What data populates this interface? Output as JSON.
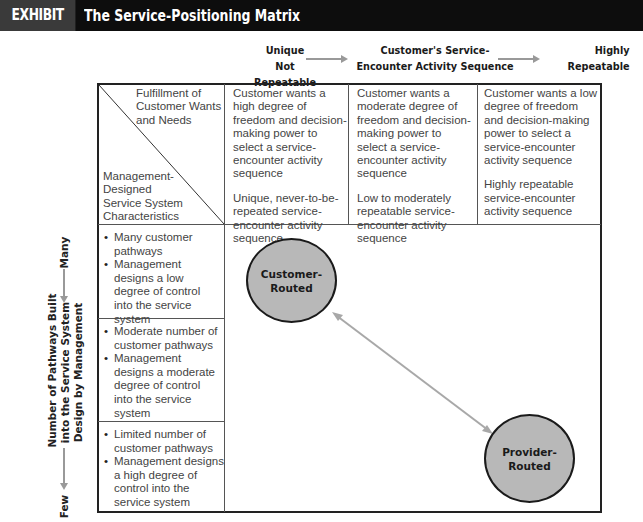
{
  "header": {
    "exhibit_label": "EXHIBIT 7.3",
    "title": "The Service-Positioning Matrix"
  },
  "top_axis": {
    "left_label_line1": "Unique",
    "left_label_line2": "Not Repeatable",
    "center_label_line1": "Customer's Service-",
    "center_label_line2": "Encounter Activity Sequence",
    "right_label_line1": "Highly",
    "right_label_line2": "Repeatable"
  },
  "left_axis": {
    "top_label": "Many",
    "center_label_line1": "Number of Pathways Built",
    "center_label_line2": "into the Service System",
    "center_label_line3": "Design by Management",
    "bottom_label": "Few"
  },
  "corner_cell": {
    "top_right_line1": "Fulfillment of",
    "top_right_line2": "Customer Wants",
    "top_right_line3": "and Needs",
    "bottom_left_line1": "Management-",
    "bottom_left_line2": "Designed",
    "bottom_left_line3": "Service System",
    "bottom_left_line4": "Characteristics"
  },
  "columns": [
    {
      "wants": "Customer wants a high degree of freedom and decision-making power to select a service-encounter activity sequence",
      "sequence": "Unique, never-to-be-repeated service-encounter activity sequence"
    },
    {
      "wants": "Customer wants a moderate degree of freedom and decision-making power to select a service-encounter activity sequence",
      "sequence": "Low to moderately repeatable service-encounter activity sequence"
    },
    {
      "wants": "Customer wants a low degree of freedom and decision-making power to select a service-encounter activity sequence",
      "sequence": "Highly repeatable service-encounter activity sequence"
    }
  ],
  "rows": [
    {
      "pathways": "Many customer pathways",
      "control": "Management designs a low degree of control into the service system"
    },
    {
      "pathways": "Moderate number of customer pathways",
      "control": "Management designs a moderate degree of control into the service system"
    },
    {
      "pathways": "Limited number of customer pathways",
      "control": "Management designs a high degree of control into the service system"
    }
  ],
  "nodes": {
    "customer_routed_line1": "Customer-",
    "customer_routed_line2": "Routed",
    "provider_routed_line1": "Provider-",
    "provider_routed_line2": "Routed"
  },
  "colors": {
    "title_bar": "#0d0d0d",
    "exhibit_tab": "#3a3a3a",
    "circle_fill": "#b8b8b8",
    "arrow": "#999999"
  }
}
